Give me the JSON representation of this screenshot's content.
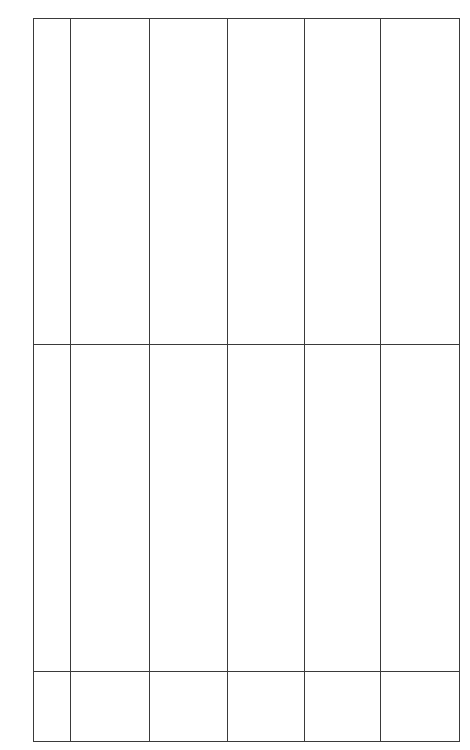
{
  "table": {
    "columns": 6,
    "rows": [
      {
        "cells": [
          "",
          "",
          "",
          "",
          "",
          ""
        ]
      },
      {
        "cells": [
          "",
          "",
          "",
          "",
          "",
          ""
        ]
      },
      {
        "cells": [
          "",
          "",
          "",
          "",
          "",
          ""
        ]
      }
    ]
  },
  "colors": {
    "border": "#3a3a3a",
    "background": "#ffffff"
  }
}
